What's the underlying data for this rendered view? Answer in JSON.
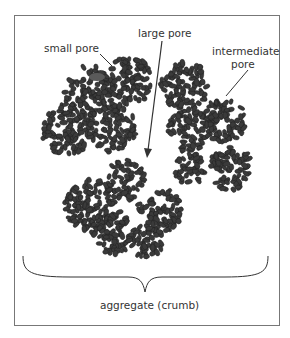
{
  "diagram": {
    "labels": {
      "small_pore": "small pore",
      "large_pore": "large pore",
      "intermediate_line1": "intermediate",
      "intermediate_line2": "pore",
      "aggregate": "aggregate (crumb)"
    },
    "colors": {
      "particle": "#3a3a3a",
      "particle_stroke": "#1e1e1e",
      "small_pore_particle": "#5a5a5a",
      "arrow": "#333333",
      "frame": "#777777"
    },
    "clusters": [
      {
        "cx": 90,
        "cy": 92,
        "r": 26
      },
      {
        "cx": 130,
        "cy": 80,
        "r": 24
      },
      {
        "cx": 68,
        "cy": 130,
        "r": 26
      },
      {
        "cx": 112,
        "cy": 128,
        "r": 24
      },
      {
        "cx": 185,
        "cy": 85,
        "r": 24
      },
      {
        "cx": 225,
        "cy": 120,
        "r": 22
      },
      {
        "cx": 190,
        "cy": 130,
        "r": 22
      },
      {
        "cx": 230,
        "cy": 168,
        "r": 22
      },
      {
        "cx": 190,
        "cy": 168,
        "r": 16
      },
      {
        "cx": 90,
        "cy": 205,
        "r": 26
      },
      {
        "cx": 125,
        "cy": 180,
        "r": 20
      },
      {
        "cx": 160,
        "cy": 210,
        "r": 22
      },
      {
        "cx": 112,
        "cy": 232,
        "r": 22
      },
      {
        "cx": 145,
        "cy": 240,
        "r": 18
      }
    ]
  }
}
